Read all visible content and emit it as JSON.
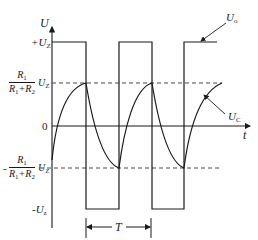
{
  "diagram": {
    "axes": {
      "y_label": "U",
      "x_label": "t",
      "origin_label": "0"
    },
    "levels": {
      "pos_supply": "+U",
      "pos_supply_sub": "Z",
      "neg_supply": "-U",
      "neg_supply_sub": "z",
      "threshold_num": "R",
      "threshold_num_sub": "1",
      "threshold_den_a": "R",
      "threshold_den_a_sub": "1",
      "threshold_den_plus": "+R",
      "threshold_den_b_sub": "2",
      "threshold_uz": "U",
      "threshold_uz_sub": "Z",
      "neg_prefix": "-"
    },
    "curves": {
      "output_label": "U",
      "output_sub": "o",
      "capacitor_label": "U",
      "capacitor_sub": "C"
    },
    "period": {
      "label": "T"
    },
    "colors": {
      "line": "#1a1a1a",
      "dashed": "#333333",
      "background": "#ffffff"
    }
  }
}
